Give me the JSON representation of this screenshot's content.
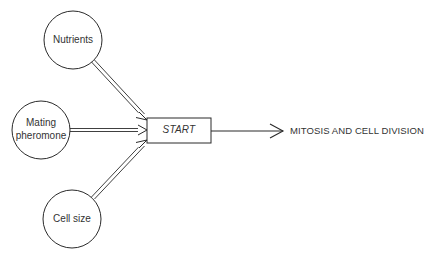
{
  "diagram": {
    "inputs": [
      {
        "id": "nutrients",
        "label": "Nutrients"
      },
      {
        "id": "mating-pheromone",
        "label_line1": "Mating",
        "label_line2": "pheromone"
      },
      {
        "id": "cell-size",
        "label": "Cell size"
      }
    ],
    "checkpoint": {
      "label": "START"
    },
    "outcome": {
      "label": "MITOSIS AND CELL DIVISION"
    },
    "colors": {
      "stroke": "#2a2a2a",
      "background": "#ffffff"
    }
  }
}
